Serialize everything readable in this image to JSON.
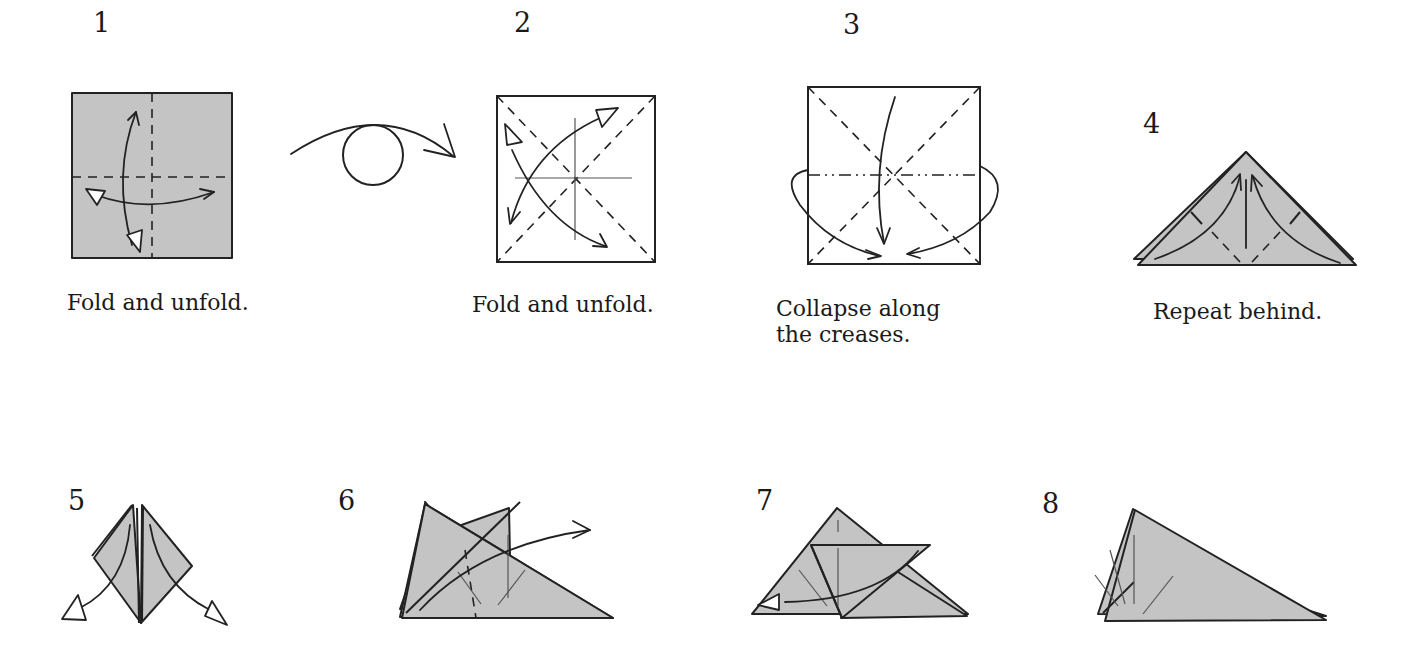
{
  "colors": {
    "paper": "#c4c4c4",
    "line": "#222222",
    "background": "#ffffff"
  },
  "steps": [
    {
      "number": "1",
      "caption": "Fold and unfold.",
      "figure": "gray square with horizontal and vertical valley folds, two push-pull arrows"
    },
    {
      "number": "",
      "caption": "",
      "figure": "turn-over symbol (arc arrow looping around a circle)"
    },
    {
      "number": "2",
      "caption": "Fold and unfold.",
      "figure": "white square with two diagonal valley folds and center creases, two double arrows"
    },
    {
      "number": "3",
      "caption": "Collapse along\nthe creases.",
      "figure": "white square with diagonal valley folds and horizontal mountain fold, three collapse arrows"
    },
    {
      "number": "4",
      "caption": "Repeat behind.",
      "figure": "gray triangle (waterbomb base) with flap folds and upward arrows"
    },
    {
      "number": "5",
      "caption": "",
      "figure": "diamond shape with two flaps being unfolded outward"
    },
    {
      "number": "6",
      "caption": "",
      "figure": "triangle with valley fold and arrow swinging flap right"
    },
    {
      "number": "7",
      "caption": "",
      "figure": "triangle with flap folded across, arrow returning it left"
    },
    {
      "number": "8",
      "caption": "",
      "figure": "final triangle with radiating crease lines"
    }
  ]
}
